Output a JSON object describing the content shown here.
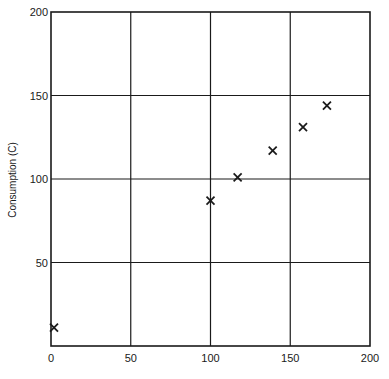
{
  "chart_data": {
    "type": "scatter",
    "title": "",
    "xlabel": "",
    "ylabel": "Consumption (C)",
    "xlim": [
      0,
      200
    ],
    "ylim": [
      0,
      200
    ],
    "grid": true,
    "marker": "x",
    "x_ticks": [
      0,
      50,
      100,
      150,
      200
    ],
    "y_ticks": [
      50,
      100,
      150,
      200
    ],
    "series": [
      {
        "name": "Consumption",
        "points": [
          {
            "x": 0,
            "y": 11
          },
          {
            "x": 100,
            "y": 87
          },
          {
            "x": 117,
            "y": 101
          },
          {
            "x": 139,
            "y": 117
          },
          {
            "x": 158,
            "y": 131
          },
          {
            "x": 173,
            "y": 144
          }
        ]
      }
    ]
  },
  "colors": {
    "line": "#1a1a1a",
    "background": "#ffffff"
  }
}
